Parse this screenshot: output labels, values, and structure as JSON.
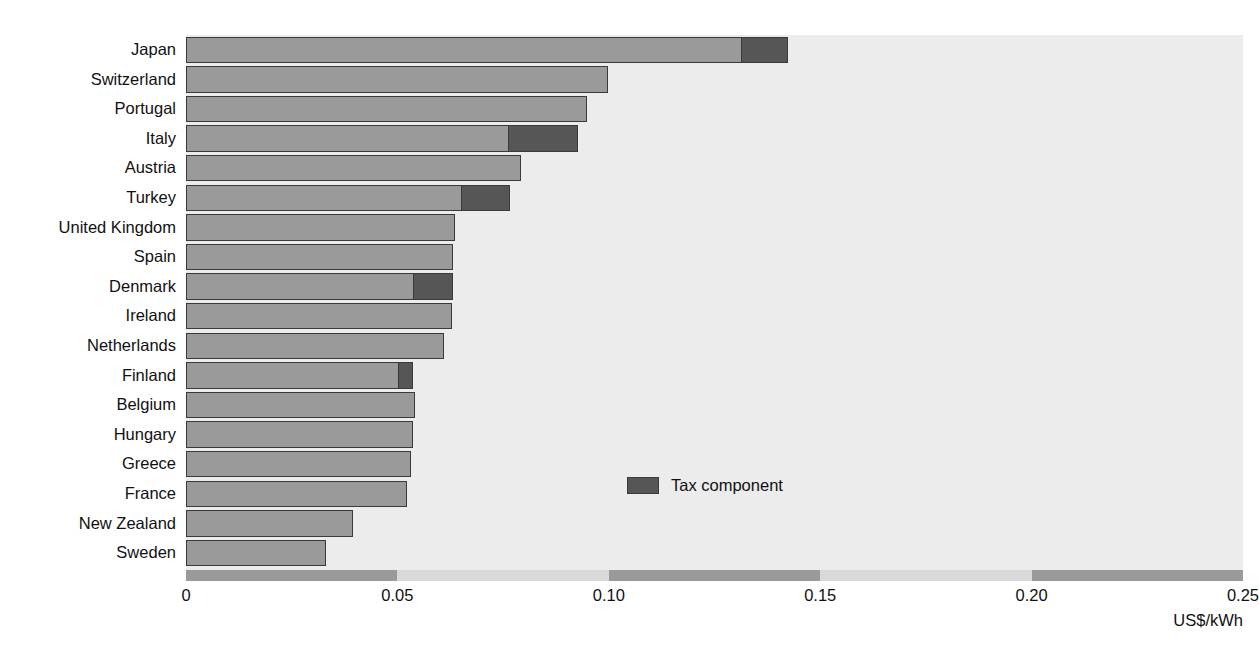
{
  "chart_data": {
    "type": "bar",
    "orientation": "horizontal",
    "stacked": true,
    "title": "",
    "subtitle": "",
    "xlabel": "US$/kWh",
    "ylabel": "",
    "xlim": [
      0,
      0.25
    ],
    "xticks": [
      0,
      0.05,
      0.1,
      0.15,
      0.2,
      0.25
    ],
    "xtick_labels": [
      "0",
      "0.05",
      "0.10",
      "0.15",
      "0.20",
      "0.25"
    ],
    "grid": false,
    "legend_position": "inside-center",
    "categories": [
      "Japan",
      "Switzerland",
      "Portugal",
      "Italy",
      "Austria",
      "Turkey",
      "United Kingdom",
      "Spain",
      "Denmark",
      "Ireland",
      "Netherlands",
      "Finland",
      "Belgium",
      "Hungary",
      "Greece",
      "France",
      "New Zealand",
      "Sweden"
    ],
    "series": [
      {
        "name": "Price excluding tax",
        "color": "#9a9a9a",
        "values": [
          0.1315,
          0.0998,
          0.0949,
          0.0764,
          0.0792,
          0.0653,
          0.0636,
          0.0632,
          0.0539,
          0.063,
          0.061,
          0.0504,
          0.0542,
          0.0537,
          0.0532,
          0.0523,
          0.0395,
          0.0331
        ]
      },
      {
        "name": "Tax component",
        "color": "#565656",
        "values": [
          0.011,
          0.0,
          0.0,
          0.0163,
          0.0,
          0.0113,
          0.0,
          0.0,
          0.0093,
          0.0,
          0.0,
          0.0033,
          0.0,
          0.0,
          0.0,
          0.0,
          0.0,
          0.0
        ]
      }
    ],
    "totals": [
      0.1425,
      0.0998,
      0.0949,
      0.0927,
      0.0792,
      0.0766,
      0.0636,
      0.0632,
      0.0632,
      0.063,
      0.061,
      0.0537,
      0.0542,
      0.0537,
      0.0532,
      0.0523,
      0.0395,
      0.0331
    ]
  },
  "legend": {
    "label": "Tax component",
    "swatch_color": "#565656"
  },
  "axis": {
    "unit_label": "US$/kWh"
  },
  "colors": {
    "plot_background": "#ececec",
    "bar_base": "#9a9a9a",
    "bar_tax": "#565656",
    "bar_outline": "#3a3a3a",
    "axis_band_dark": "#9a9a9a",
    "axis_band_light": "#d9d9d9",
    "text": "#111111"
  }
}
